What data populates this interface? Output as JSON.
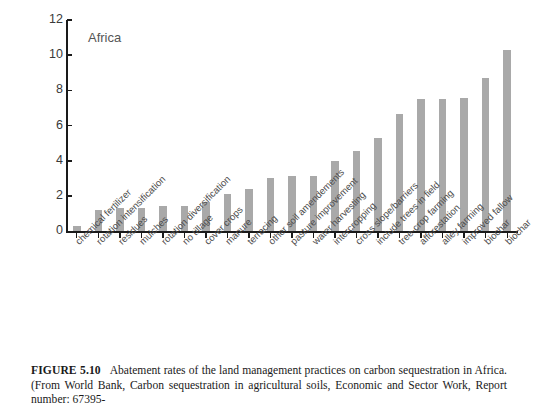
{
  "figure": {
    "annotation": "Africa",
    "y_axis_title_html": "t CO<sub>2</sub>e ha<sup>-1</sup>year<sup>-1</sup>",
    "y_axis_title_text": "t CO2e ha-1year-1"
  },
  "caption": {
    "label": "FIGURE 5.10",
    "text": "Abatement rates of the land management practices on carbon sequestration in Africa. (From World Bank, Carbon sequestration in agricultural soils, Economic and Sector Work, Report number: 67395-"
  },
  "chart_data": {
    "type": "bar",
    "title": "",
    "subtitle": "",
    "annotation": "Africa",
    "xlabel": "",
    "ylabel": "t CO2e ha-1year-1",
    "ylim": [
      0,
      12
    ],
    "yticks": [
      0,
      2,
      4,
      6,
      8,
      10,
      12
    ],
    "ytick_labels": [
      "0",
      "2",
      "4",
      "6",
      "8",
      "10",
      "12"
    ],
    "grid": false,
    "legend": false,
    "bar_color": "#a9a9a9",
    "categories": [
      "chemical fertilizer",
      "rotation intensification",
      "residues",
      "mulches",
      "rotation diversification",
      "no tillage",
      "cover crops",
      "manure",
      "terracing",
      "other soil amendements",
      "pasture improvement",
      "water harvesting",
      "intercropping",
      "cross slope/barriers",
      "include trees in field",
      "tree-crop farming",
      "afforestation",
      "alley farming",
      "improved fallow",
      "biochar"
    ],
    "values": [
      0.3,
      1.2,
      1.35,
      1.35,
      1.45,
      1.45,
      1.65,
      2.15,
      2.4,
      3.05,
      3.15,
      3.15,
      4.0,
      4.55,
      5.3,
      6.65,
      7.5,
      7.5,
      7.6,
      8.7
    ],
    "extra_category": "biochar",
    "extra_value": 10.3
  }
}
